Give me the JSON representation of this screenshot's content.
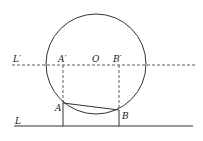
{
  "diagram": {
    "labels": {
      "line_top": "L′",
      "line_bottom": "L",
      "point_a_prime": "A′",
      "point_b_prime": "B′",
      "center": "O",
      "point_a": "A",
      "point_b": "B"
    },
    "colors": {
      "stroke": "#333333",
      "background": "#ffffff"
    }
  }
}
